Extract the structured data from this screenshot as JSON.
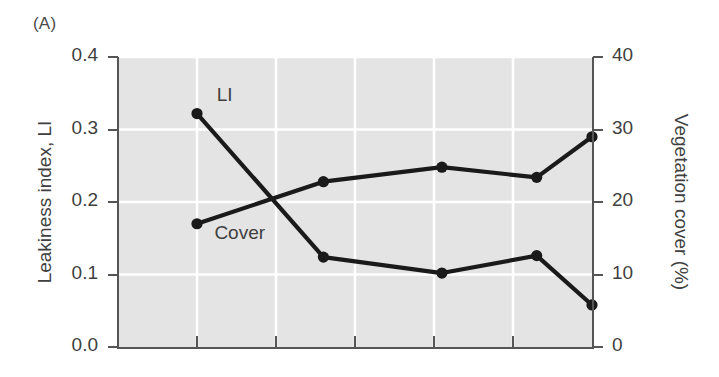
{
  "panel": {
    "label": "(A)"
  },
  "chart_data": {
    "type": "line",
    "title": "",
    "subtitle": "",
    "xlabel": "",
    "ylabel": "Leakiness index, LI",
    "y2label": "Vegetation cover (%)",
    "ylim": [
      0.0,
      0.4
    ],
    "y2lim": [
      0,
      40
    ],
    "xlim": [
      0,
      6
    ],
    "grid": true,
    "grid_color": "#ffffff",
    "plot_background": "#e4e4e4",
    "legend": "inline-labels",
    "legend_position": "inline",
    "x": [
      1,
      2,
      3,
      4,
      5,
      6
    ],
    "xticks": [
      1,
      2,
      3,
      4,
      5
    ],
    "xticklabels": [
      "",
      "",
      "",
      "",
      ""
    ],
    "yticks": [
      0.0,
      0.1,
      0.2,
      0.3,
      0.4
    ],
    "yticklabels": [
      "0.0",
      "0.1",
      "0.2",
      "0.3",
      "0.4"
    ],
    "y2ticks": [
      0,
      10,
      20,
      30,
      40
    ],
    "y2ticklabels": [
      "0",
      "10",
      "20",
      "30",
      "40"
    ],
    "series": [
      {
        "name": "LI",
        "axis": "left",
        "color": "#1a1a1a",
        "marker": "filled-circle",
        "values": [
          0.322,
          0.124,
          0.102,
          0.126,
          0.058
        ],
        "x": [
          1,
          2.6,
          4.1,
          5.3,
          6.0
        ]
      },
      {
        "name": "Cover",
        "axis": "right",
        "color": "#1a1a1a",
        "marker": "filled-circle",
        "values": [
          17.0,
          22.8,
          24.8,
          23.4,
          29.0
        ],
        "x": [
          1,
          2.6,
          4.1,
          5.3,
          6.0
        ]
      }
    ],
    "annotations": [
      {
        "text": "LI",
        "x": 1.25,
        "y": 0.345
      },
      {
        "text": "Cover",
        "x": 1.22,
        "y": 0.155
      }
    ]
  }
}
